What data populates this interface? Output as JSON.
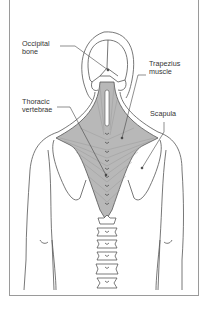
{
  "diagram": {
    "labels": {
      "occipital": "Occipital\nbone",
      "trapezius": "Trapezius\nmuscle",
      "thoracic": "Thoracic\nvertebrae",
      "scapula": "Scapula"
    },
    "colors": {
      "outline": "#555555",
      "muscle_fill": "#b8b8b8",
      "muscle_lines": "#8a8a8a",
      "frame": "#9a9a9a"
    }
  }
}
